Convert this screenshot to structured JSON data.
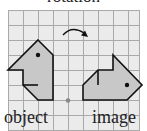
{
  "title": "rotation",
  "labels": {
    "object": "object",
    "image": "image"
  },
  "colors": {
    "background": "#ebebeb",
    "grid": "#a9a9a9",
    "shape_fill": "#c8c8c8",
    "outline": "#111111",
    "center_point": "#888888"
  },
  "grid": {
    "x0": 8,
    "y0": 10,
    "cell": 15,
    "cols": 9,
    "rows": 8,
    "width": 132,
    "height": 120
  },
  "object_shape": {
    "points": [
      [
        38,
        40
      ],
      [
        53,
        55
      ],
      [
        53,
        100
      ],
      [
        38,
        100
      ],
      [
        23,
        85
      ],
      [
        23,
        70
      ],
      [
        8,
        70
      ]
    ],
    "inner_line": [
      [
        23,
        85
      ],
      [
        38,
        85
      ]
    ],
    "dot": [
      38,
      55
    ]
  },
  "image_shape": {
    "points": [
      [
        83,
        85
      ],
      [
        98,
        70
      ],
      [
        113,
        70
      ],
      [
        113,
        55
      ],
      [
        143,
        85
      ],
      [
        128,
        100
      ],
      [
        83,
        100
      ]
    ],
    "inner_line": [
      [
        98,
        70
      ],
      [
        98,
        85
      ]
    ],
    "dot": [
      128,
      85
    ]
  },
  "center_of_rotation": [
    68,
    100
  ],
  "rotation_arrow": {
    "direction": "clockwise"
  }
}
